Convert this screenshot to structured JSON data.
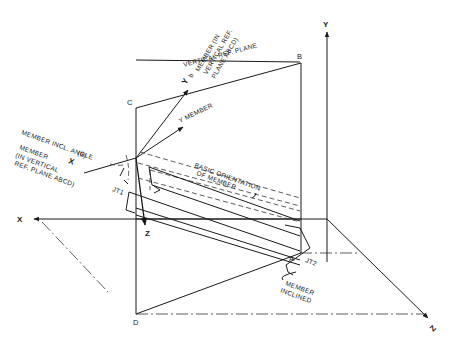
{
  "diagram": {
    "axes": {
      "x": "X",
      "y": "Y",
      "z": "Z",
      "member_z": "Z"
    },
    "points": {
      "a": "A",
      "b": "B",
      "c": "C",
      "d": "D"
    },
    "joints": {
      "jt1": "JT1",
      "jt2": "JT2"
    },
    "labels": {
      "vertical_ref_plane": "VERTICAL REF. PLANE",
      "y_member": "Y MEMBER",
      "yb": "Y",
      "yb_sub": "b",
      "yb_desc_1": "MEMBER (IN",
      "yb_desc_2": "VERTICAL REF.",
      "yb_desc_3": "PLANE ABCD)",
      "incl_angle_1": "MEMBER INCL. ANGLE",
      "incl_angle_2": "(θ)",
      "x_member_1": "MEMBER",
      "x_member_x": "X",
      "x_member_2": "(IN VERTICAL",
      "x_member_3": "REF. PLANE ABCD)",
      "basic_orient_1": "BASIC ORIENTATION",
      "basic_orient_2": "OF MEMBER",
      "member_inclined_1": "MEMBER",
      "member_inclined_2": "INCLINED"
    }
  }
}
